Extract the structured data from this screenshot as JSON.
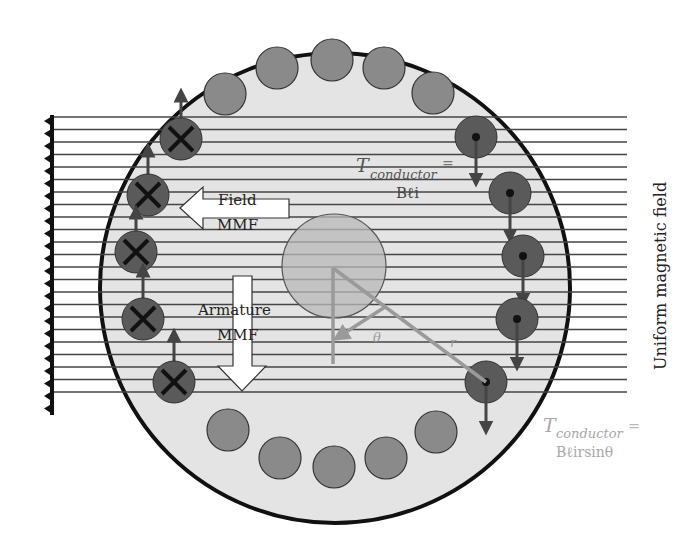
{
  "colors": {
    "background": "#ffffff",
    "stator_fill": "#e4e4e4",
    "stator_outline": "#111111",
    "field_line": "#444444",
    "slot_empty": "#8a8a8a",
    "conductor_active": "#5a5a5a",
    "rotor": "#b8b8b8",
    "vector": "#9a9a9a",
    "faint_text": "#a8a8a8",
    "dark_text": "#222222"
  },
  "labels": {
    "field_mmf_line1": "Field",
    "field_mmf_line2": "MMF",
    "armature_mmf_line1": "Armature",
    "armature_mmf_line2": "MMF",
    "torque_top_T": "T",
    "torque_top_sub": "conductor",
    "torque_top_eq": "=",
    "torque_top_expr": "Bℓi",
    "torque_bottom_T": "T",
    "torque_bottom_sub": "conductor",
    "torque_bottom_eq": "=",
    "torque_bottom_expr": "Bℓirsinθ",
    "theta": "θ",
    "radius": "r",
    "field_label": "Uniform magnetic field"
  },
  "symbols": {
    "into_page_conductor": "cross-icon",
    "out_of_page_conductor": "dot-icon",
    "force_up": "arrow-up-icon",
    "force_down": "arrow-down-icon"
  },
  "conductors": {
    "into_page_count": 5,
    "out_of_page_count": 5,
    "empty_slots_top": 4,
    "empty_slots_bottom": 6
  }
}
